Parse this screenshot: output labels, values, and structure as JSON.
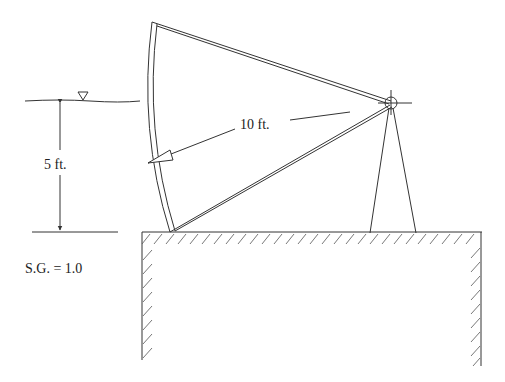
{
  "diagram": {
    "type": "tainter-gate",
    "labels": {
      "depth": "5 ft.",
      "radius": "10 ft.",
      "specific_gravity": "S.G. = 1.0"
    },
    "symbols": {
      "water_surface": "inverted-triangle-icon",
      "pivot": "pivot-hinge-icon"
    },
    "colors": {
      "line": "#333333",
      "background": "#ffffff"
    }
  }
}
